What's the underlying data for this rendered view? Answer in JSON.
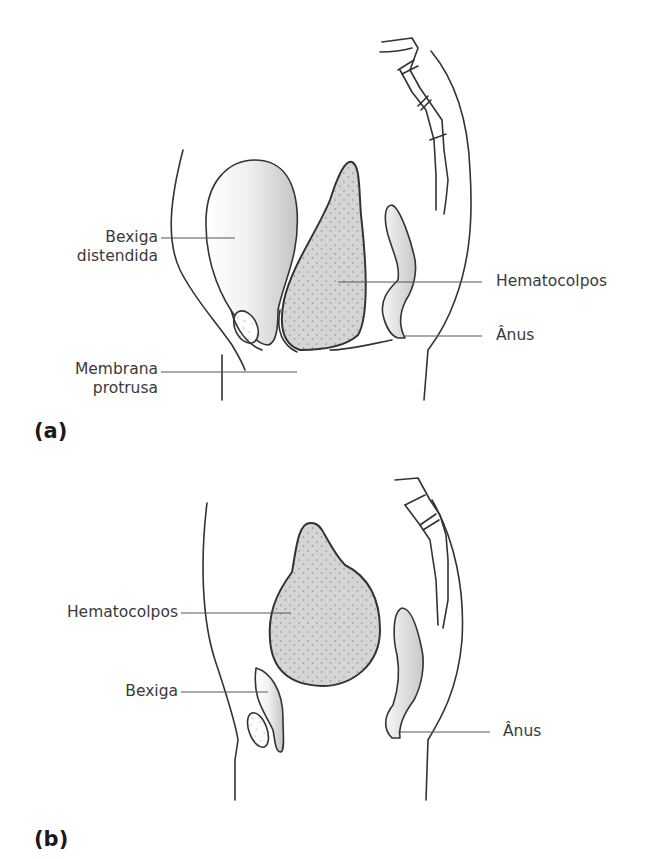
{
  "figure": {
    "panel_a": {
      "label": "(a)",
      "annotations": {
        "bladder_line1": "Bexiga",
        "bladder_line2": "distendida",
        "membrane_line1": "Membrana",
        "membrane_line2": "protrusa",
        "hematocolpos": "Hematocolpos",
        "anus": "Ânus"
      }
    },
    "panel_b": {
      "label": "(b)",
      "annotations": {
        "hematocolpos": "Hematocolpos",
        "bladder": "Bexiga",
        "anus": "Ânus"
      }
    },
    "colors": {
      "outline": "#333333",
      "leader_line": "#555555",
      "fill_shade": "#d0d0d0",
      "dot": "#8a8a8a"
    }
  }
}
